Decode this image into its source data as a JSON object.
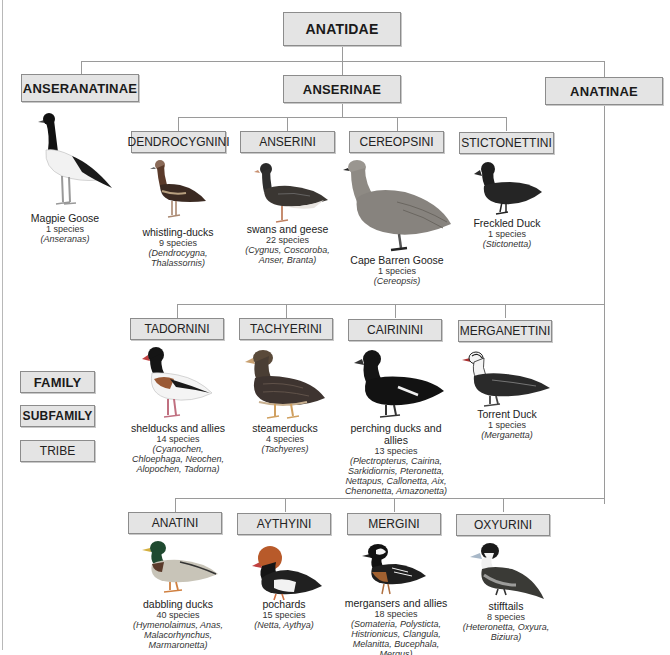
{
  "diagram": {
    "type": "taxonomy-tree",
    "family": {
      "label": "ANATIDAE"
    },
    "subfamilies": [
      {
        "label": "ANSERANATINAE",
        "direct_species": {
          "common_name": "Magpie Goose",
          "count": "1 species",
          "genera": "(Anseranas)",
          "icon": "magpie-goose-illustration"
        }
      },
      {
        "label": "ANSERINAE",
        "tribes": [
          {
            "label": "DENDROCYGNINI",
            "common_name": "whistling-ducks",
            "count": "9 species",
            "genera_lines": [
              "(Dendrocygna,",
              "Thalassornis)"
            ],
            "icon": "whistling-duck-illustration"
          },
          {
            "label": "ANSERINI",
            "common_name": "swans and geese",
            "count": "22 species",
            "genera_lines": [
              "(Cygnus, Coscoroba,",
              "Anser, Branta)"
            ],
            "icon": "goose-illustration"
          },
          {
            "label": "CEREOPSINI",
            "common_name": "Cape Barren Goose",
            "count": "1 species",
            "genera_lines": [
              "(Cereopsis)"
            ],
            "icon": "cape-barren-goose-illustration"
          },
          {
            "label": "STICTONETTINI",
            "common_name": "Freckled Duck",
            "count": "1 species",
            "genera_lines": [
              "(Stictonetta)"
            ],
            "icon": "freckled-duck-illustration"
          }
        ]
      },
      {
        "label": "ANATINAE",
        "tribes": [
          {
            "label": "TADORNINI",
            "common_name": "shelducks and allies",
            "count": "14 species",
            "genera_lines": [
              "(Cyanochen,",
              "Chloephaga, Neochen,",
              "Alopochen, Tadorna)"
            ],
            "icon": "shelduck-illustration"
          },
          {
            "label": "TACHYERINI",
            "common_name": "steamerducks",
            "count": "4 species",
            "genera_lines": [
              "(Tachyeres)"
            ],
            "icon": "steamerduck-illustration"
          },
          {
            "label": "CAIRININI",
            "common_name": "perching ducks and allies",
            "count": "13 species",
            "genera_lines": [
              "(Plectropterus, Cairina,",
              "Sarkidiornis, Pteronetta,",
              "Nettapus, Callonetta, Aix,",
              "Chenonetta, Amazonetta)"
            ],
            "icon": "muscovy-duck-illustration"
          },
          {
            "label": "MERGANETTINI",
            "common_name": "Torrent Duck",
            "count": "1 species",
            "genera_lines": [
              "(Merganetta)"
            ],
            "icon": "torrent-duck-illustration"
          },
          {
            "label": "ANATINI",
            "common_name": "dabbling ducks",
            "count": "40 species",
            "genera_lines": [
              "(Hymenolaimus, Anas,",
              "Malacorhynchus,",
              "Marmaronetta)"
            ],
            "icon": "mallard-illustration"
          },
          {
            "label": "AYTHYINI",
            "common_name": "pochards",
            "count": "15 species",
            "genera_lines": [
              "(Netta, Aythya)"
            ],
            "icon": "pochard-illustration"
          },
          {
            "label": "MERGINI",
            "common_name": "mergansers and allies",
            "count": "18 species",
            "genera_lines": [
              "(Somateria, Polysticta,",
              "Histrionicus, Clangula,",
              "Melanitta, Bucephala,",
              "Mergus)"
            ],
            "icon": "merganser-illustration"
          },
          {
            "label": "OXYURINI",
            "common_name": "stifftails",
            "count": "8 species",
            "genera_lines": [
              "(Heteronetta, Oxyura,",
              "Biziura)"
            ],
            "icon": "stifftail-illustration"
          }
        ]
      }
    ],
    "legend": [
      {
        "label": "FAMILY",
        "level": "family"
      },
      {
        "label": "SUBFAMILY",
        "level": "subfamily"
      },
      {
        "label": "TRIBE",
        "level": "tribe"
      }
    ],
    "colors": {
      "box_fill": "#e4e4e4",
      "box_border": "#8c8c8c",
      "connector": "#9a9a9a",
      "background": "#ffffff"
    }
  }
}
